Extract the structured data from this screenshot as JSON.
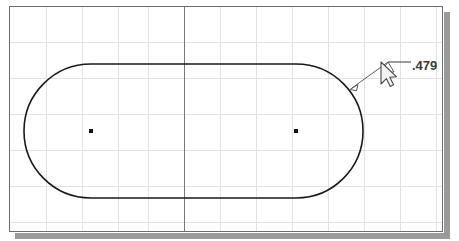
{
  "app": {
    "type": "cad-sketch-canvas",
    "background_color": "#ffffff",
    "border_color": "#6d6d6d",
    "shadow_color": "#9a9a9a"
  },
  "grid": {
    "minor_color": "#e2e2e2",
    "axis_color": "#7a7a7a",
    "spacing_px": 36,
    "vertical_axis_x": 184,
    "visible": true,
    "vertical_lines_x": [
      46,
      82,
      118,
      148,
      184,
      220,
      256,
      292,
      328,
      364,
      400,
      436
    ],
    "horizontal_lines_y": [
      42,
      78,
      114,
      150,
      186,
      222
    ]
  },
  "geometry": {
    "shape_name": "slot",
    "shape_label": "obround-slot-profile",
    "line_color": "#1a1a1a",
    "line_width": 1.6,
    "radius": 67,
    "left_center": {
      "x": 91,
      "y": 131
    },
    "right_center": {
      "x": 296,
      "y": 131
    },
    "top_y": 64,
    "bottom_y": 198,
    "left_x": 24,
    "right_x": 363,
    "center_point_color": "#111111",
    "center_point_size": 4
  },
  "dimension": {
    "value": ".479",
    "label_name": "radius-dimension",
    "text_color": "#3b3b3b",
    "leader_color": "#5a5a5a",
    "arrow_tip": {
      "x": 352,
      "y": 88
    },
    "elbow": {
      "x": 388,
      "y": 62
    },
    "shoulder_end": {
      "x": 411,
      "y": 62
    },
    "text_position": {
      "x": 412,
      "y": 58
    }
  },
  "cursor": {
    "type": "arrow-pointer",
    "x": 381,
    "y": 62,
    "color": "#f2f2f2",
    "outline_color": "#4a4a4a"
  }
}
